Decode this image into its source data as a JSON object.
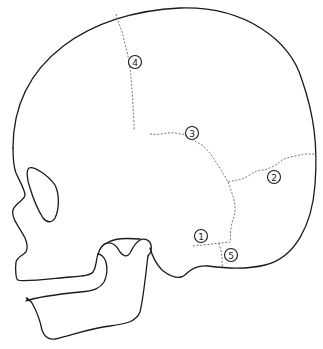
{
  "diagram": {
    "colors": {
      "background": "#ffffff",
      "outline": "#1a1a1a",
      "suture": "#6b6b6b"
    },
    "markers": [
      {
        "id": "1",
        "label": "1",
        "cx": 201,
        "cy": 236
      },
      {
        "id": "2",
        "label": "2",
        "cx": 274,
        "cy": 177
      },
      {
        "id": "3",
        "label": "3",
        "cx": 192,
        "cy": 133
      },
      {
        "id": "4",
        "label": "4",
        "cx": 135,
        "cy": 62
      },
      {
        "id": "5",
        "label": "5",
        "cx": 231,
        "cy": 255
      }
    ]
  }
}
